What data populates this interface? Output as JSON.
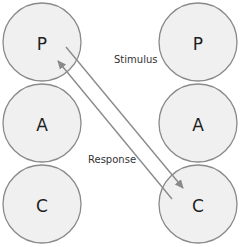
{
  "diagram": {
    "left_column": [
      {
        "label": "P",
        "cx": 42,
        "cy": 42
      },
      {
        "label": "A",
        "cx": 42,
        "cy": 123
      },
      {
        "label": "C",
        "cx": 42,
        "cy": 204
      }
    ],
    "right_column": [
      {
        "label": "P",
        "cx": 198,
        "cy": 42
      },
      {
        "label": "A",
        "cx": 198,
        "cy": 123
      },
      {
        "label": "C",
        "cx": 198,
        "cy": 204
      }
    ],
    "radius": 39,
    "arrows": [
      {
        "name": "stimulus",
        "label": "Stimulus",
        "from": "left P",
        "to": "right C"
      },
      {
        "name": "response",
        "label": "Response",
        "from": "right C",
        "to": "left P"
      }
    ],
    "colors": {
      "circle_fill": "#f0f0f0",
      "circle_stroke": "#8a8a8a",
      "arrow": "#8a8a8a",
      "text": "#1e1e1e"
    }
  }
}
